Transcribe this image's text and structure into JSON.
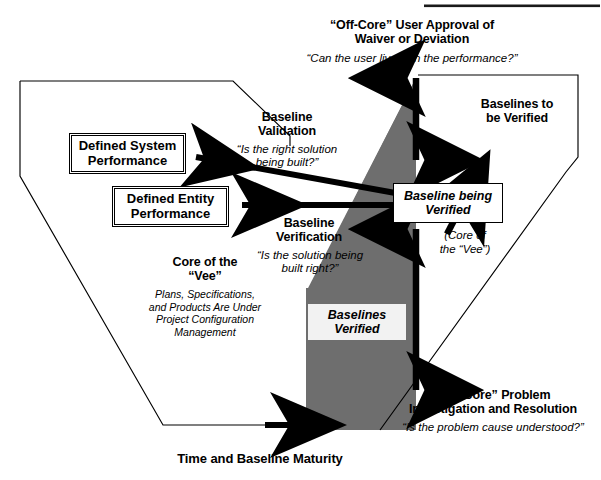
{
  "diagram": {
    "title_rule": "top-divider-rule",
    "colors": {
      "core_fill": "#6e6e6e",
      "outline": "#000000",
      "box_fill": "#ffffff",
      "pale_box": "#f2f2f2"
    },
    "offcore_top": {
      "heading_line1": "“Off-Core” User Approval of",
      "heading_line2": "Waiver or Deviation",
      "question": "“Can the user live with the performance?”"
    },
    "baseline_validation": {
      "heading_line1": "Baseline",
      "heading_line2": "Validation",
      "question_line1": "“Is the right solution",
      "question_line2": "being built?”"
    },
    "baseline_verification": {
      "heading_line1": "Baseline",
      "heading_line2": "Verification",
      "question_line1": "“Is the solution being",
      "question_line2": "built right?”"
    },
    "core_of_vee": {
      "heading_line1": "Core of the",
      "heading_line2": "“Vee”",
      "detail_line1": "Plans, Specifications,",
      "detail_line2": "and Products Are Under",
      "detail_line3": "Project Configuration",
      "detail_line4": "Management"
    },
    "boxes": {
      "defined_system_performance_line1": "Defined System",
      "defined_system_performance_line2": "Performance",
      "defined_entity_performance_line1": "Defined Entity",
      "defined_entity_performance_line2": "Performance",
      "baseline_being_verified_line1": "Baseline being",
      "baseline_being_verified_line2": "Verified",
      "baselines_verified_line1": "Baselines",
      "baselines_verified_line2": "Verified"
    },
    "baselines_to_be_verified": {
      "line1": "Baselines to",
      "line2": "be Verified"
    },
    "core_of_vee_note": {
      "line1": "(Core of",
      "line2": "the “Vee”)"
    },
    "offcore_bottom": {
      "heading_line1": "“Off-Core” Problem",
      "heading_line2": "Investigation and Resolution",
      "question": "“Is the problem cause understood?”"
    },
    "axis_label": "Time and Baseline Maturity"
  }
}
